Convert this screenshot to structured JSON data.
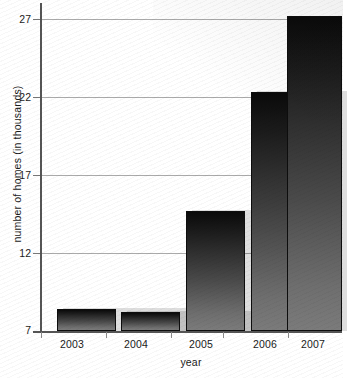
{
  "chart_data": {
    "type": "bar",
    "title": "",
    "xlabel": "year",
    "ylabel": "number of homes (in thousands)",
    "categories": [
      "2003",
      "2004",
      "2005",
      "2006",
      "2007"
    ],
    "values": [
      8.4,
      8.2,
      14.7,
      22.3,
      27.2
    ],
    "ylim": [
      7,
      28
    ],
    "yticks": [
      7,
      12,
      17,
      22,
      27
    ],
    "ytick_labels": [
      "7",
      "12",
      "17",
      "22",
      "27"
    ],
    "grid": true,
    "legend": false,
    "series": [
      {
        "name": "number of homes",
        "values": [
          8.4,
          8.2,
          14.7,
          22.3,
          27.2
        ]
      }
    ],
    "bar_color": "#2b2b2b",
    "gridline_color": "#aaaaaa",
    "axis_color": "#555555",
    "background_color": "#ffffff"
  }
}
